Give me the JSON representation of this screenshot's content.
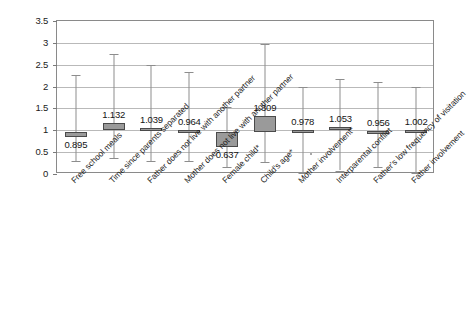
{
  "chart_data": {
    "type": "bar",
    "title": "",
    "subtitle": "",
    "xlabel": "",
    "ylabel": "",
    "ylim": [
      0,
      3.5
    ],
    "ytick_labels": [
      "0",
      "0.5",
      "1",
      "1.5",
      "2",
      "2.5",
      "3",
      "3.5"
    ],
    "ytick_values": [
      0,
      0.5,
      1,
      1.5,
      2,
      2.5,
      3,
      3.5
    ],
    "grid": true,
    "legend": "none",
    "reference_line": 1,
    "categories": [
      "Free school meals",
      "Time since parents separated",
      "Father does not live with another partner",
      "Mother does not live with another partner",
      "Female child*",
      "Child's age*",
      "Mother involvement*",
      "Interparental conflict",
      "Father's low frequency of visitation",
      "Father involvement"
    ],
    "values": [
      0.895,
      1.132,
      1.039,
      0.964,
      0.637,
      1.309,
      0.978,
      1.053,
      0.956,
      1.002
    ],
    "value_labels": [
      "0.895",
      "1.132",
      "1.039",
      "0.964",
      "0.637",
      "1.309",
      "0.978",
      "1.053",
      "0.956",
      "1.002"
    ],
    "value_label_position": [
      "below",
      "above",
      "above",
      "above",
      "below",
      "above",
      "above",
      "above",
      "above",
      "above"
    ],
    "series": [
      {
        "name": "Odds ratio with 95% confidence interval",
        "points": [
          {
            "category": "Free school meals",
            "estimate": 0.895,
            "box_low": 0.85,
            "box_high": 0.95,
            "whisker_low": 0.3,
            "whisker_high": 2.27
          },
          {
            "category": "Time since parents separated",
            "estimate": 1.132,
            "box_low": 1.01,
            "box_high": 1.17,
            "whisker_low": 0.36,
            "whisker_high": 2.75
          },
          {
            "category": "Father does not live with another partner",
            "estimate": 1.039,
            "box_low": 1.0,
            "box_high": 1.06,
            "whisker_low": 0.3,
            "whisker_high": 2.49
          },
          {
            "category": "Mother does not live with another partner",
            "estimate": 0.964,
            "box_low": 0.95,
            "box_high": 1.0,
            "whisker_low": 0.3,
            "whisker_high": 2.33
          },
          {
            "category": "Female child*",
            "estimate": 0.637,
            "box_low": 0.62,
            "box_high": 0.97,
            "whisker_low": 0.17,
            "whisker_high": 1.53
          },
          {
            "category": "Child's age*",
            "estimate": 1.309,
            "box_low": 0.97,
            "box_high": 1.33,
            "whisker_low": 0.27,
            "whisker_high": 2.98
          },
          {
            "category": "Mother involvement*",
            "estimate": 0.978,
            "box_low": 0.95,
            "box_high": 1.0,
            "whisker_low": 0.02,
            "whisker_high": 1.98
          },
          {
            "category": "Interparental conflict",
            "estimate": 1.053,
            "box_low": 1.0,
            "box_high": 1.08,
            "whisker_low": 0.08,
            "whisker_high": 2.17
          },
          {
            "category": "Father's low frequency of visitation",
            "estimate": 0.956,
            "box_low": 0.93,
            "box_high": 0.99,
            "whisker_low": 0.17,
            "whisker_high": 2.1
          },
          {
            "category": "Father involvement",
            "estimate": 1.002,
            "box_low": 0.99,
            "box_high": 1.01,
            "whisker_low": 0.02,
            "whisker_high": 2.0
          }
        ]
      }
    ],
    "colors": {
      "box_fill": "#9a9a9a",
      "box_border": "#4a4a4a",
      "whisker": "#8d8d8d",
      "gridline": "#b9b9b9",
      "axis": "#8a8a8a",
      "text": "#1a1a1a",
      "background": "#ffffff"
    }
  }
}
